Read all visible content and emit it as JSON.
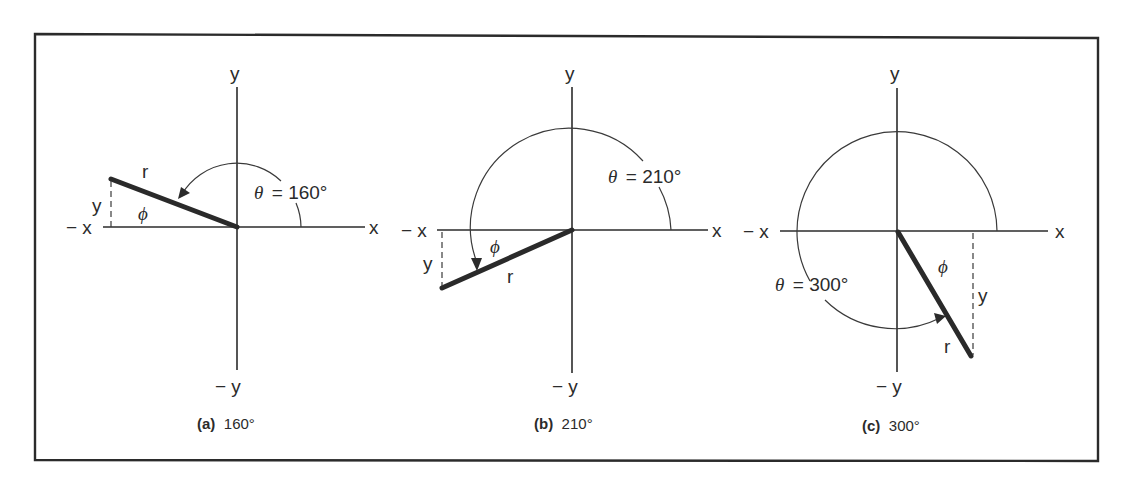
{
  "figure": {
    "colors": {
      "ink": "#2b2b2b",
      "background": "#ffffff"
    },
    "panels": [
      {
        "id": "a",
        "caption_tag": "(a)",
        "caption_value": "160°",
        "theta_label": "θ = 160°",
        "theta_symbol": "θ",
        "theta_text": "= 160°",
        "angle_deg": 160,
        "axis_labels": {
          "pos_y": "y",
          "neg_y": "− y",
          "pos_x": "x",
          "neg_x": "− x"
        },
        "r_label": "r",
        "phi_label": "ϕ",
        "y_component_label": "y"
      },
      {
        "id": "b",
        "caption_tag": "(b)",
        "caption_value": "210°",
        "theta_label": "θ = 210°",
        "theta_symbol": "θ",
        "theta_text": "= 210°",
        "angle_deg": 210,
        "axis_labels": {
          "pos_y": "y",
          "neg_y": "− y",
          "pos_x": "x",
          "neg_x": "− x"
        },
        "r_label": "r",
        "phi_label": "ϕ",
        "y_component_label": "y"
      },
      {
        "id": "c",
        "caption_tag": "(c)",
        "caption_value": "300°",
        "theta_label": "θ = 300°",
        "theta_symbol": "θ",
        "theta_text": "= 300°",
        "angle_deg": 300,
        "axis_labels": {
          "pos_y": "y",
          "neg_y": "− y",
          "pos_x": "x",
          "neg_x": "− x"
        },
        "r_label": "r",
        "phi_label": "ϕ",
        "y_component_label": "y"
      }
    ]
  }
}
